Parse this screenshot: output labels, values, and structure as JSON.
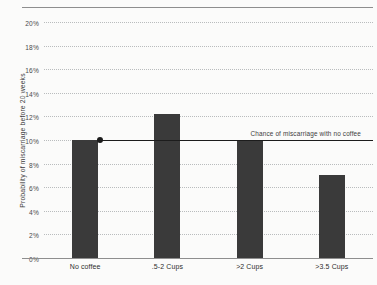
{
  "chart_data": {
    "type": "bar",
    "title": "",
    "subtitle": "",
    "xlabel": "",
    "ylabel": "Probability of miscarriage before 20 weeks",
    "categories": [
      "No coffee",
      ".5-2 Cups",
      ">2 Cups",
      ">3.5 Cups"
    ],
    "values": [
      10.0,
      12.2,
      10.0,
      7.0
    ],
    "ylim": [
      0,
      20
    ],
    "ytick_values": [
      0,
      2,
      4,
      6,
      8,
      10,
      12,
      14,
      16,
      18,
      20
    ],
    "ytick_labels": [
      "0%",
      "2%",
      "4%",
      "6%",
      "8%",
      "10%",
      "12%",
      "14%",
      "16%",
      "18%",
      "20%"
    ],
    "grid": true,
    "legend": "none",
    "bar_color": "#3a3a3a",
    "background_color": "#fbfbfa",
    "gridline_color": "#b9bcbd",
    "axis_color": "#8e8e8e",
    "annotations": [
      {
        "label": "Chance of miscarriage with no coffee",
        "value": 10.0,
        "type": "reference-line",
        "color": "#1c1c1c",
        "marker": "dot"
      }
    ]
  }
}
